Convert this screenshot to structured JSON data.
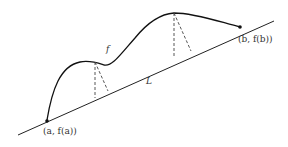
{
  "diagram": {
    "curve_label": "f",
    "line_label": "L",
    "point_a_label": "(a, f(a))",
    "point_b_label": "(b, f(b))",
    "colors": {
      "stroke": "#222222",
      "dashed": "#444444",
      "background": "#ffffff"
    }
  }
}
